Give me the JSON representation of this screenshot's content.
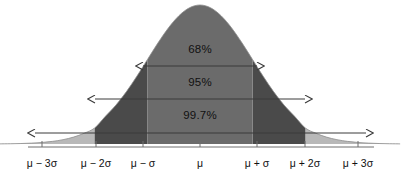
{
  "figure": {
    "background_color": "#ffffff",
    "width": 401,
    "height": 179
  },
  "colors": {
    "curve_core": "#6b6b6b",
    "band_mid": "#4a4a4a",
    "band_outer": "#b8b8b8",
    "axis": "#6e6e6e",
    "arrow": "#3a3a3a",
    "text": "#111111"
  },
  "chart_data": {
    "type": "line",
    "title": "",
    "xlabel": "",
    "ylabel": "",
    "grid": false,
    "legend": "none",
    "xlim": [
      -3.8,
      3.8
    ],
    "ylim": [
      0,
      1
    ],
    "mean": 0,
    "sigma": 1,
    "x_tick_values": [
      -3,
      -2,
      -1,
      0,
      1,
      2,
      3
    ],
    "x_tick_labels": [
      "μ − 3σ",
      "μ − 2σ",
      "μ − σ",
      "μ",
      "μ + σ",
      "μ + 2σ",
      "μ + 3σ"
    ],
    "series": [
      {
        "name": "Normal probability density",
        "x": [
          -3.8,
          -3.6,
          -3.4,
          -3.2,
          -3.0,
          -2.8,
          -2.6,
          -2.4,
          -2.2,
          -2.0,
          -1.8,
          -1.6,
          -1.4,
          -1.2,
          -1.0,
          -0.8,
          -0.6,
          -0.4,
          -0.2,
          0.0,
          0.2,
          0.4,
          0.6,
          0.8,
          1.0,
          1.2,
          1.4,
          1.6,
          1.8,
          2.0,
          2.2,
          2.4,
          2.6,
          2.8,
          3.0,
          3.2,
          3.4,
          3.6,
          3.8
        ],
        "y": [
          0.0008,
          0.0018,
          0.0034,
          0.0063,
          0.0111,
          0.0189,
          0.0312,
          0.0498,
          0.0773,
          0.1154,
          0.1979,
          0.278,
          0.3753,
          0.4868,
          0.6065,
          0.7261,
          0.8353,
          0.9231,
          0.9802,
          1.0,
          0.9802,
          0.9231,
          0.8353,
          0.7261,
          0.6065,
          0.4868,
          0.3753,
          0.278,
          0.1979,
          0.1154,
          0.0773,
          0.0498,
          0.0312,
          0.0189,
          0.0111,
          0.0063,
          0.0034,
          0.0018,
          0.0008
        ]
      }
    ],
    "shaded_regions": [
      {
        "name": "within-1-sigma",
        "from": -1,
        "to": 1,
        "color": "#6b6b6b",
        "coverage_percent": 68
      },
      {
        "name": "one-to-two-sigma-left",
        "from": -2,
        "to": -1,
        "color": "#4a4a4a",
        "coverage_percent": 13.5
      },
      {
        "name": "one-to-two-sigma-right",
        "from": 1,
        "to": 2,
        "color": "#4a4a4a",
        "coverage_percent": 13.5
      },
      {
        "name": "beyond-two-sigma-left",
        "from": -3.8,
        "to": -2,
        "color": "#b8b8b8",
        "coverage_percent": 2.5
      },
      {
        "name": "beyond-two-sigma-right",
        "from": 2,
        "to": 3.8,
        "color": "#b8b8b8",
        "coverage_percent": 2.5
      }
    ],
    "annotations": [
      {
        "label": "68%",
        "from_sigma": -1,
        "to_sigma": 1,
        "arrow": "double"
      },
      {
        "label": "95%",
        "from_sigma": -2,
        "to_sigma": 2,
        "arrow": "double"
      },
      {
        "label": "99.7%",
        "from_sigma": -3,
        "to_sigma": 3,
        "arrow": "double"
      }
    ]
  },
  "annotations": {
    "band_68": {
      "label": "68%",
      "label_x": 200,
      "label_y": 50,
      "line_y": 66,
      "x1": 143,
      "x2": 257
    },
    "band_95": {
      "label": "95%",
      "label_x": 200,
      "label_y": 83,
      "line_y": 99,
      "x1": 95,
      "x2": 305
    },
    "band_997": {
      "label": "99.7%",
      "label_x": 200,
      "label_y": 116,
      "line_y": 133,
      "x1": 35,
      "x2": 366
    }
  },
  "axis": {
    "line_y": 147,
    "tick_positions_px": [
      42,
      96,
      143,
      200,
      257,
      305,
      358
    ],
    "label_y": 158,
    "labels": [
      {
        "text": "μ − 3σ",
        "x": 42
      },
      {
        "text": "μ − 2σ",
        "x": 96
      },
      {
        "text": "μ − σ",
        "x": 143
      },
      {
        "text": "μ",
        "x": 200
      },
      {
        "text": "μ + σ",
        "x": 257
      },
      {
        "text": "μ + 2σ",
        "x": 305
      },
      {
        "text": "μ + 3σ",
        "x": 358
      }
    ]
  }
}
